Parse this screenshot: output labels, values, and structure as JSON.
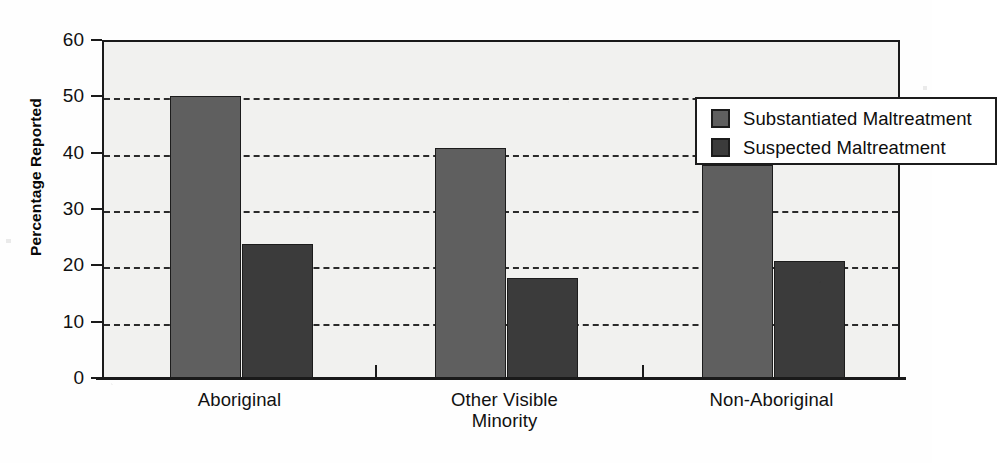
{
  "chart_data": {
    "type": "bar",
    "title": "",
    "xlabel": "",
    "ylabel": "Percentage Reported",
    "ylim": [
      0,
      60
    ],
    "ytick_step": 10,
    "yticks": [
      "0",
      "10",
      "20",
      "30",
      "40",
      "50",
      "60"
    ],
    "grid": true,
    "grid_style": "dashed horizontal",
    "legend_position": "top-right inside plot",
    "categories": [
      "Aboriginal",
      "Other Visible Minority",
      "Non-Aboriginal"
    ],
    "category_lines": [
      [
        "Aboriginal"
      ],
      [
        "Other Visible",
        "Minority"
      ],
      [
        "Non-Aboriginal"
      ]
    ],
    "series": [
      {
        "name": "Substantiated Maltreatment",
        "color": "#5f5f5f",
        "values": [
          50.0,
          40.8,
          37.8
        ]
      },
      {
        "name": "Suspected Maltreatment",
        "color": "#3b3b3b",
        "values": [
          23.8,
          17.8,
          20.8
        ]
      }
    ]
  },
  "axis": {
    "y_title": "Percentage Reported"
  },
  "legend": {
    "entries": [
      {
        "label": "Substantiated Maltreatment"
      },
      {
        "label": "Suspected Maltreatment"
      }
    ]
  },
  "colors": {
    "series_substantiated": "#5f5f5f",
    "series_suspected": "#3b3b3b",
    "plot_background": "#f1f1ef",
    "axis_line": "#1a1a1a",
    "gridline": "#2b2b2b",
    "legend_background": "#ffffff",
    "page_background": "#fefefe"
  }
}
